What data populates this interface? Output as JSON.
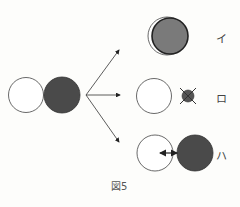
{
  "figure": {
    "caption": "図5",
    "source_pair": {
      "left": "white-circle",
      "right": "dark-circle"
    },
    "outcomes": [
      {
        "label": "イ",
        "description": "overlapped circles (gray circle in front of white)"
      },
      {
        "label": "ロ",
        "description": "white circle with crossed-out small dark circle"
      },
      {
        "label": "ハ",
        "description": "white circle and dark circle with double-headed arrow"
      }
    ],
    "colors": {
      "dark": "#4a4a4a",
      "gray": "#7a7a7a",
      "stroke": "#333333",
      "background": "#fdfdfb"
    }
  }
}
